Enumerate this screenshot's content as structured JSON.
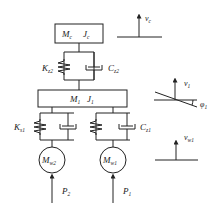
{
  "diagram": {
    "type": "vehicle vibration model (mass-spring-damper)",
    "masses": {
      "car_body": {
        "mass": "M",
        "mass_sub": "c",
        "inertia": "J",
        "inertia_sub": "c"
      },
      "bogie": {
        "mass": "M",
        "mass_sub": "1",
        "inertia": "J",
        "inertia_sub": "1"
      },
      "wheel_2": {
        "mass": "M",
        "mass_sub": "w2"
      },
      "wheel_1": {
        "mass": "M",
        "mass_sub": "w1"
      }
    },
    "secondary_suspension": {
      "spring": {
        "sym": "K",
        "sub": "z2"
      },
      "damper": {
        "sym": "C",
        "sub": "z2"
      }
    },
    "primary_suspension": {
      "spring": {
        "sym": "K",
        "sub": "s1"
      },
      "damper": {
        "sym": "C",
        "sub": "z1"
      }
    },
    "forces": {
      "p2": {
        "sym": "P",
        "sub": "2"
      },
      "p1": {
        "sym": "P",
        "sub": "1"
      }
    },
    "coordinates": {
      "vc": {
        "sym": "v",
        "sub": "c"
      },
      "v1": {
        "sym": "v",
        "sub": "1"
      },
      "phi1": {
        "sym": "φ",
        "sub": "1"
      },
      "vw1": {
        "sym": "v",
        "sub": "w1"
      }
    },
    "colors": {
      "line": "#222222",
      "background": "#ffffff"
    }
  }
}
